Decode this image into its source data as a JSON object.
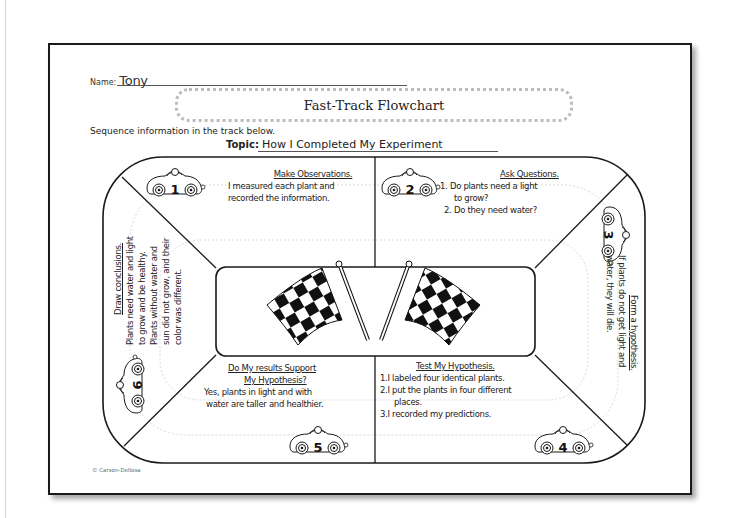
{
  "worksheet": {
    "name_label": "Name:",
    "name_value": "Tony",
    "title": "Fast-Track Flowchart",
    "instruction": "Sequence information in the track below.",
    "topic_label": "Topic:",
    "topic_value": "How I Completed My Experiment",
    "copyright": "© Carson-Dellosa"
  },
  "steps": [
    {
      "number": "1",
      "heading": "Make Observations.",
      "lines": [
        "I measured each plant and",
        "recorded the information."
      ]
    },
    {
      "number": "2",
      "heading": "Ask Questions.",
      "lines": [
        "1. Do plants need a light",
        "to grow?",
        "2. Do they need water?"
      ]
    },
    {
      "number": "3",
      "heading": "Form a hypothesis.",
      "lines": [
        "If plants do not get light and",
        "water, they will die."
      ]
    },
    {
      "number": "4",
      "heading": "Test My Hypothesis.",
      "lines": [
        "1.I labeled four identical plants.",
        "2.I put the plants in four different",
        "places.",
        "3.I recorded my predictions."
      ]
    },
    {
      "number": "5",
      "heading": "Do My results Support",
      "heading2": "My Hypothesis?",
      "lines": [
        "Yes, plants in light and with",
        "water are taller and healthier."
      ]
    },
    {
      "number": "6",
      "heading": "Draw conclusions.",
      "lines": [
        "Plants need water and light",
        "to grow and be healthy.",
        "Plants without water and",
        "sun did not grow, and their",
        "color was different."
      ]
    }
  ],
  "icons": {
    "car": "race-car-icon",
    "flags": "checkered-flags-icon"
  },
  "colors": {
    "ink": "#1a1a1a",
    "lane_dash": "#c8c8c8",
    "title_dots": "#bdbdbd"
  }
}
